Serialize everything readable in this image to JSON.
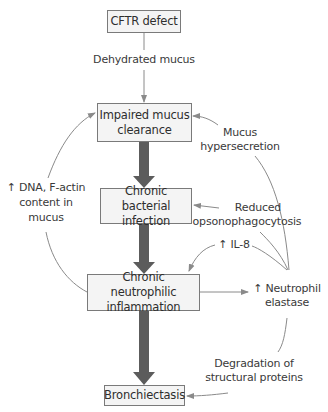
{
  "diagram": {
    "type": "flowchart",
    "colors": {
      "box_border": "#7a7a7a",
      "box_fill": "#f4f4f4",
      "main_arrow": "#5c5c5c",
      "thin_arrow": "#8a8a8a",
      "text": "#2e2e2e"
    },
    "nodes": {
      "cftr": "CFTR defect",
      "impaired_1": "Impaired mucus",
      "impaired_2": "clearance",
      "infection_1": "Chronic bacterial",
      "infection_2": "infection",
      "inflammation_1": "Chronic neutrophilic",
      "inflammation_2": "inflammation",
      "bronchiectasis": "Bronchiectasis"
    },
    "labels": {
      "dehydrated": "Dehydrated mucus",
      "hyper_1": "Mucus",
      "hyper_2": "hypersecretion",
      "dna_1": "↑ DNA, F-actin",
      "dna_2": "content in",
      "dna_3": "mucus",
      "opsono_1": "Reduced",
      "opsono_2": "opsonophagocytosis",
      "il8": "↑ IL-8",
      "elastase_1": "↑ Neutrophil",
      "elastase_2": "elastase",
      "degradation_1": "Degradation of",
      "degradation_2": "structural proteins"
    },
    "edges": [
      {
        "from": "CFTR defect",
        "to": "Impaired mucus clearance",
        "label": "Dehydrated mucus"
      },
      {
        "from": "Impaired mucus clearance",
        "to": "Chronic bacterial infection",
        "style": "thick"
      },
      {
        "from": "Chronic bacterial infection",
        "to": "Chronic neutrophilic inflammation",
        "style": "thick"
      },
      {
        "from": "Chronic neutrophilic inflammation",
        "to": "Bronchiectasis",
        "style": "thick"
      },
      {
        "from": "Chronic neutrophilic inflammation",
        "to": "Impaired mucus clearance",
        "label": "↑ DNA, F-actin content in mucus"
      },
      {
        "from": "Chronic neutrophilic inflammation",
        "to": "↑ Neutrophil elastase"
      },
      {
        "from": "↑ Neutrophil elastase",
        "to": "Impaired mucus clearance",
        "label": "Mucus hypersecretion"
      },
      {
        "from": "↑ Neutrophil elastase",
        "to": "Chronic bacterial infection",
        "label": "Reduced opsonophagocytosis"
      },
      {
        "from": "↑ Neutrophil elastase",
        "to": "Chronic neutrophilic inflammation",
        "label": "↑ IL-8"
      },
      {
        "from": "↑ Neutrophil elastase",
        "to": "Bronchiectasis",
        "label": "Degradation of structural proteins"
      }
    ]
  }
}
